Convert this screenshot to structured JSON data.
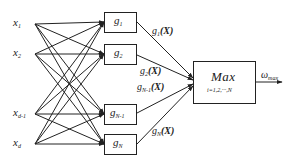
{
  "diagram": {
    "type": "max-network",
    "colors": {
      "stroke": "#222222",
      "text": "#222222",
      "background": "#ffffff"
    },
    "inputs": [
      {
        "base": "x",
        "sub": "1",
        "y": 24
      },
      {
        "base": "x",
        "sub": "2",
        "y": 54
      },
      {
        "base": "x",
        "sub": "d-1",
        "y": 114
      },
      {
        "base": "x",
        "sub": "d",
        "y": 144
      }
    ],
    "functions": [
      {
        "base": "g",
        "sub": "1",
        "y": 22
      },
      {
        "base": "g",
        "sub": "2",
        "y": 54
      },
      {
        "base": "g",
        "sub": "N-1",
        "y": 114
      },
      {
        "base": "g",
        "sub": "N",
        "y": 144
      }
    ],
    "edge_labels": [
      {
        "base": "g",
        "sub": "1",
        "arg": "(X)"
      },
      {
        "base": "g",
        "sub": "2",
        "arg": "(X)"
      },
      {
        "base": "g",
        "sub": "N-1",
        "arg": "(X)"
      },
      {
        "base": "g",
        "sub": "N",
        "arg": "(X)"
      }
    ],
    "max_block": {
      "title": "Max",
      "subtitle": "i=1,2,···,N"
    },
    "output": {
      "base": "ω",
      "sub": "max"
    }
  }
}
